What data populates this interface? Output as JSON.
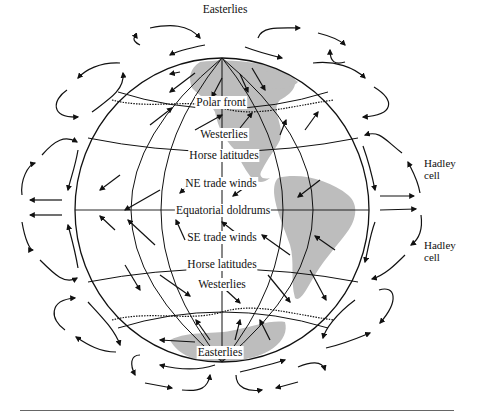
{
  "figure": {
    "globe_labels": [
      {
        "text": "Easterlies",
        "x": 225,
        "y": 4
      },
      {
        "text": "Polar front",
        "x": 221,
        "y": 97
      },
      {
        "text": "Westerlies",
        "x": 224,
        "y": 129
      },
      {
        "text": "Horse latitudes",
        "x": 224,
        "y": 150
      },
      {
        "text": "NE trade winds",
        "x": 221,
        "y": 178
      },
      {
        "text": "Equatorial doldrums",
        "x": 223,
        "y": 205
      },
      {
        "text": "SE trade winds",
        "x": 222,
        "y": 232
      },
      {
        "text": "Horse latitudes",
        "x": 222,
        "y": 259
      },
      {
        "text": "Westerlies",
        "x": 222,
        "y": 278
      },
      {
        "text": "Easterlies",
        "x": 220,
        "y": 349
      }
    ],
    "side_labels": [
      {
        "line1": "Hadley",
        "line2": "cell",
        "x": 424,
        "y": 159
      },
      {
        "line1": "Hadley",
        "line2": "cell",
        "x": 424,
        "y": 240
      }
    ],
    "colors": {
      "line": "#111111",
      "land": "#bdbdbd",
      "rule": "#666666"
    }
  }
}
